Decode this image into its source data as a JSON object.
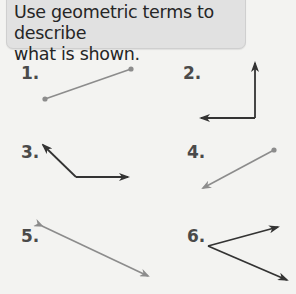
{
  "prompt": {
    "line1": "Use geometric terms to describe",
    "line2": "what is shown."
  },
  "colors": {
    "background": "#f3f3f1",
    "prompt_box": "#e1e1e1",
    "gray_figure": "#8c8c8c",
    "dark_figure": "#333333",
    "label": "#4a4a4a"
  },
  "exercises": [
    {
      "number": "1.",
      "figure": "line-segment"
    },
    {
      "number": "2.",
      "figure": "right-angle-two-rays"
    },
    {
      "number": "3.",
      "figure": "obtuse-angle-two-rays"
    },
    {
      "number": "4.",
      "figure": "ray"
    },
    {
      "number": "5.",
      "figure": "line"
    },
    {
      "number": "6.",
      "figure": "acute-angle-two-rays"
    }
  ]
}
